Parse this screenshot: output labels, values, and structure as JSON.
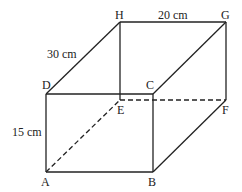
{
  "diagram": {
    "type": "cuboid",
    "vertices": {
      "A": {
        "label": "A",
        "x": 46,
        "y": 172
      },
      "B": {
        "label": "B",
        "x": 153,
        "y": 172
      },
      "C": {
        "label": "C",
        "x": 153,
        "y": 94
      },
      "D": {
        "label": "D",
        "x": 46,
        "y": 94
      },
      "E": {
        "label": "E",
        "x": 120,
        "y": 100
      },
      "F": {
        "label": "F",
        "x": 226,
        "y": 100
      },
      "G": {
        "label": "G",
        "x": 226,
        "y": 22
      },
      "H": {
        "label": "H",
        "x": 120,
        "y": 22
      }
    },
    "dimensions": {
      "HG": "20 cm",
      "DH": "30 cm",
      "AD": "15 cm"
    },
    "hidden_edges": [
      "AE",
      "EF"
    ],
    "colors": {
      "line": "#222222",
      "text": "#222222",
      "background": "#ffffff"
    }
  }
}
